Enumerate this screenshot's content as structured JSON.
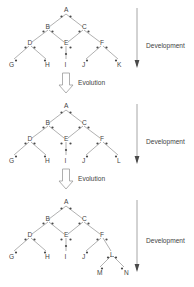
{
  "figure": {
    "type": "developmental-evolution-trees",
    "panel_count": 3,
    "edge_color": "#8a8a8a",
    "node_color": "#4a4a4a",
    "text_color": "#3f3f3f",
    "background": "#ffffff"
  },
  "panels": [
    {
      "id": "panel-1",
      "development_label": "Development",
      "evolution_label": "Evolution",
      "has_evolution_arrow": true,
      "nodes": [
        {
          "label": "A",
          "x": 66,
          "y": 12
        },
        {
          "label": "B",
          "x": 48,
          "y": 28
        },
        {
          "label": "C",
          "x": 84,
          "y": 28
        },
        {
          "label": "D",
          "x": 30,
          "y": 44
        },
        {
          "label": "E",
          "x": 66,
          "y": 44
        },
        {
          "label": "F",
          "x": 102,
          "y": 44
        },
        {
          "label": "G",
          "x": 12,
          "y": 62
        },
        {
          "label": "H",
          "x": 48,
          "y": 62
        },
        {
          "label": "I",
          "x": 66,
          "y": 62
        },
        {
          "label": "J",
          "x": 84,
          "y": 62
        },
        {
          "label": "K",
          "x": 120,
          "y": 62
        }
      ],
      "edges": [
        [
          "A",
          "B"
        ],
        [
          "A",
          "C"
        ],
        [
          "B",
          "D"
        ],
        [
          "B",
          "E"
        ],
        [
          "C",
          "E"
        ],
        [
          "C",
          "F"
        ],
        [
          "D",
          "G"
        ],
        [
          "D",
          "H"
        ],
        [
          "E",
          "I"
        ],
        [
          "F",
          "J"
        ],
        [
          "F",
          "K"
        ]
      ]
    },
    {
      "id": "panel-2",
      "development_label": "Development",
      "evolution_label": "Evolution",
      "has_evolution_arrow": true,
      "nodes": [
        {
          "label": "A",
          "x": 66,
          "y": 12
        },
        {
          "label": "B",
          "x": 48,
          "y": 28
        },
        {
          "label": "C",
          "x": 84,
          "y": 28
        },
        {
          "label": "D",
          "x": 30,
          "y": 44
        },
        {
          "label": "E",
          "x": 66,
          "y": 44
        },
        {
          "label": "F",
          "x": 102,
          "y": 44
        },
        {
          "label": "G",
          "x": 12,
          "y": 62
        },
        {
          "label": "H",
          "x": 48,
          "y": 62
        },
        {
          "label": "I",
          "x": 66,
          "y": 62
        },
        {
          "label": "J",
          "x": 84,
          "y": 62
        },
        {
          "label": "L",
          "x": 120,
          "y": 62
        }
      ],
      "edges": [
        [
          "A",
          "B"
        ],
        [
          "A",
          "C"
        ],
        [
          "B",
          "D"
        ],
        [
          "B",
          "E"
        ],
        [
          "C",
          "E"
        ],
        [
          "C",
          "F"
        ],
        [
          "D",
          "G"
        ],
        [
          "D",
          "H"
        ],
        [
          "E",
          "I"
        ],
        [
          "F",
          "J"
        ],
        [
          "F",
          "L"
        ]
      ]
    },
    {
      "id": "panel-3",
      "development_label": "Development",
      "evolution_label": "",
      "has_evolution_arrow": false,
      "nodes": [
        {
          "label": "A",
          "x": 66,
          "y": 12
        },
        {
          "label": "B",
          "x": 48,
          "y": 28
        },
        {
          "label": "C",
          "x": 84,
          "y": 28
        },
        {
          "label": "D",
          "x": 30,
          "y": 44
        },
        {
          "label": "E",
          "x": 66,
          "y": 44
        },
        {
          "label": "F",
          "x": 102,
          "y": 44
        },
        {
          "label": "G",
          "x": 12,
          "y": 62
        },
        {
          "label": "H",
          "x": 48,
          "y": 62
        },
        {
          "label": "I",
          "x": 66,
          "y": 62
        },
        {
          "label": "J",
          "x": 84,
          "y": 62
        },
        {
          "label": "L",
          "x": 112,
          "y": 62
        },
        {
          "label": "M",
          "x": 98,
          "y": 78
        },
        {
          "label": "N",
          "x": 126,
          "y": 78
        }
      ],
      "edges": [
        [
          "A",
          "B"
        ],
        [
          "A",
          "C"
        ],
        [
          "B",
          "D"
        ],
        [
          "B",
          "E"
        ],
        [
          "C",
          "E"
        ],
        [
          "C",
          "F"
        ],
        [
          "D",
          "G"
        ],
        [
          "D",
          "H"
        ],
        [
          "E",
          "I"
        ],
        [
          "F",
          "J"
        ],
        [
          "F",
          "L"
        ],
        [
          "L",
          "M"
        ],
        [
          "L",
          "N"
        ]
      ]
    }
  ],
  "icons": {
    "development_arrow": "arrow-down-line-icon",
    "evolution_arrow": "hollow-arrow-down-icon"
  }
}
